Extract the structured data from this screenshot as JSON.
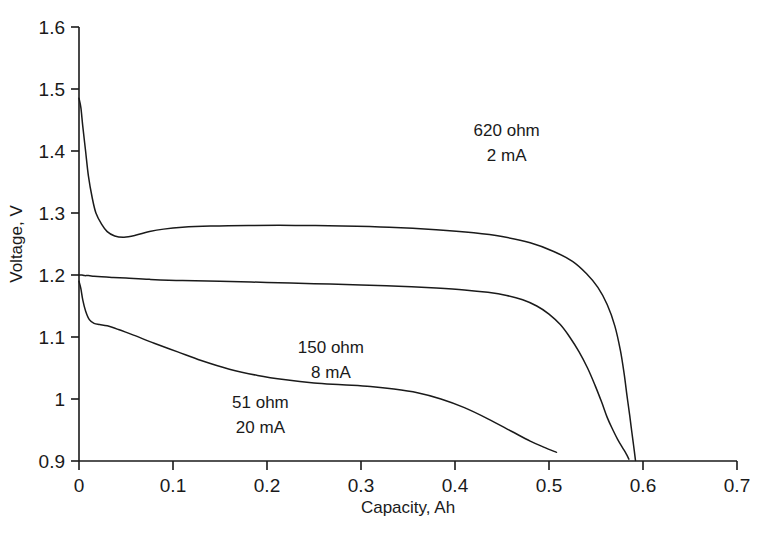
{
  "chart_data": {
    "type": "line",
    "title": "",
    "xlabel": "Capacity, Ah",
    "ylabel": "Voltage, V",
    "xlim": [
      0,
      0.7
    ],
    "ylim": [
      0.9,
      1.6
    ],
    "xticks": [
      "0",
      "0.1",
      "0.2",
      "0.3",
      "0.4",
      "0.5",
      "0.6",
      "0.7"
    ],
    "xtick_values": [
      0,
      0.1,
      0.2,
      0.3,
      0.4,
      0.5,
      0.6,
      0.7
    ],
    "yticks": [
      "0.9",
      "1",
      "1.1",
      "1.2",
      "1.3",
      "1.4",
      "1.5",
      "1.6"
    ],
    "ytick_values": [
      0.9,
      1.0,
      1.1,
      1.2,
      1.3,
      1.4,
      1.5,
      1.6
    ],
    "grid": false,
    "legend_position": "inline-annotations",
    "line_color": "#1a1a1a",
    "background_color": "#ffffff",
    "series": [
      {
        "name": "620 ohm, 2 mA",
        "label_line1": "620 ohm",
        "label_line2": "2 mA",
        "annotation_x": 0.455,
        "annotation_y": 1.425,
        "x": [
          0.0,
          0.002,
          0.004,
          0.007,
          0.01,
          0.014,
          0.018,
          0.024,
          0.03,
          0.038,
          0.048,
          0.06,
          0.075,
          0.09,
          0.11,
          0.14,
          0.18,
          0.23,
          0.28,
          0.33,
          0.38,
          0.42,
          0.45,
          0.48,
          0.505,
          0.525,
          0.54,
          0.552,
          0.562,
          0.57,
          0.576,
          0.58,
          0.583,
          0.586,
          0.588,
          0.59,
          0.592
        ],
        "y": [
          1.485,
          1.47,
          1.44,
          1.4,
          1.36,
          1.325,
          1.3,
          1.282,
          1.27,
          1.263,
          1.261,
          1.264,
          1.27,
          1.274,
          1.277,
          1.279,
          1.28,
          1.28,
          1.279,
          1.277,
          1.273,
          1.268,
          1.262,
          1.252,
          1.238,
          1.222,
          1.202,
          1.18,
          1.152,
          1.118,
          1.078,
          1.04,
          1.005,
          0.972,
          0.948,
          0.925,
          0.901
        ]
      },
      {
        "name": "150 ohm, 8 mA",
        "label_line1": "150 ohm",
        "label_line2": "8 mA",
        "annotation_x": 0.268,
        "annotation_y": 1.075,
        "x": [
          0.0,
          0.003,
          0.006,
          0.01,
          0.016,
          0.024,
          0.035,
          0.05,
          0.075,
          0.11,
          0.15,
          0.2,
          0.25,
          0.3,
          0.34,
          0.38,
          0.41,
          0.435,
          0.455,
          0.472,
          0.487,
          0.5,
          0.512,
          0.522,
          0.532,
          0.541,
          0.549,
          0.556,
          0.562,
          0.568,
          0.573,
          0.578,
          0.582,
          0.585
        ],
        "y": [
          1.2,
          1.2,
          1.199,
          1.199,
          1.198,
          1.197,
          1.196,
          1.195,
          1.193,
          1.191,
          1.19,
          1.188,
          1.186,
          1.184,
          1.182,
          1.179,
          1.176,
          1.172,
          1.167,
          1.16,
          1.15,
          1.137,
          1.12,
          1.1,
          1.076,
          1.05,
          1.022,
          0.995,
          0.97,
          0.95,
          0.935,
          0.922,
          0.912,
          0.903
        ]
      },
      {
        "name": "51 ohm, 20 mA",
        "label_line1": "51 ohm",
        "label_line2": "20 mA",
        "annotation_x": 0.193,
        "annotation_y": 0.985,
        "x": [
          0.0,
          0.002,
          0.004,
          0.007,
          0.011,
          0.016,
          0.022,
          0.03,
          0.042,
          0.058,
          0.08,
          0.105,
          0.13,
          0.16,
          0.19,
          0.22,
          0.25,
          0.28,
          0.31,
          0.335,
          0.36,
          0.385,
          0.41,
          0.435,
          0.46,
          0.48,
          0.495,
          0.508
        ],
        "y": [
          1.19,
          1.178,
          1.16,
          1.142,
          1.128,
          1.122,
          1.12,
          1.118,
          1.112,
          1.103,
          1.09,
          1.076,
          1.062,
          1.048,
          1.038,
          1.031,
          1.026,
          1.023,
          1.02,
          1.016,
          1.01,
          1.0,
          0.986,
          0.968,
          0.948,
          0.932,
          0.922,
          0.914
        ]
      }
    ]
  },
  "axes": {
    "x_title": "Capacity, Ah",
    "y_title": "Voltage, V"
  }
}
